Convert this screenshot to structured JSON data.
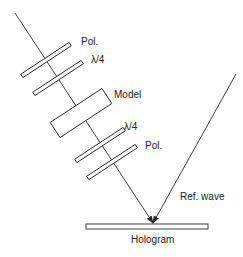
{
  "diagram": {
    "labels": {
      "pol_top": "Pol.",
      "qwp_top": "λ/4",
      "model": "Model",
      "qwp_bottom": "λ/4",
      "pol_bottom": "Pol.",
      "ref_wave": "Ref. wave",
      "hologram": "Hologram"
    },
    "colors": {
      "stroke": "#2a2a2a",
      "background": "#ffffff"
    }
  }
}
